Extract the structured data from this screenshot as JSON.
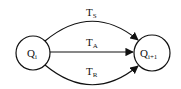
{
  "diagram": {
    "type": "state-transition",
    "nodes": [
      {
        "id": "qi",
        "label": "Q",
        "subscript": "i",
        "cx": 33,
        "cy": 53,
        "r": 17
      },
      {
        "id": "qi1",
        "label": "Q",
        "subscript": "i+1",
        "cx": 152,
        "cy": 53,
        "r": 18
      }
    ],
    "edges": [
      {
        "id": "ts",
        "from": "qi",
        "to": "qi1",
        "label": "T",
        "subscript": "S",
        "shape": "arc-up"
      },
      {
        "id": "ta",
        "from": "qi",
        "to": "qi1",
        "label": "T",
        "subscript": "A",
        "shape": "straight"
      },
      {
        "id": "tr",
        "from": "qi",
        "to": "qi1",
        "label": "T",
        "subscript": "R",
        "shape": "arc-down"
      }
    ],
    "colors": {
      "stroke": "#111111",
      "background": "#ffffff"
    }
  }
}
